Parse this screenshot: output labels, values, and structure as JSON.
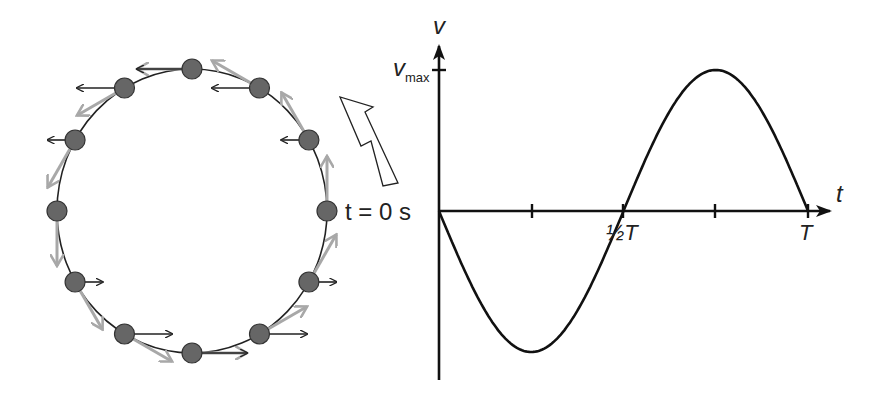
{
  "circle_diagram": {
    "title": "Uniform circular motion projected onto horizontal axis",
    "start_label": "t = 0 s",
    "direction": "counter-clockwise",
    "ball_count": 12,
    "colors": {
      "ball": "#666666",
      "velocity_arrow": "#a8a8a8",
      "horizontal_arrow": "#222222"
    }
  },
  "graph": {
    "y_axis_label": "v",
    "x_axis_label": "t",
    "y_tick_label": "v",
    "y_tick_sub": "max",
    "x_tick_half": "½T",
    "x_tick_full": "T"
  },
  "chart_data": {
    "type": "line",
    "title": "",
    "xlabel": "t",
    "ylabel": "v",
    "x": [
      "0",
      "¼T",
      "½T",
      "¾T",
      "T"
    ],
    "series": [
      {
        "name": "v(t)",
        "values": [
          0,
          -1,
          0,
          1,
          0
        ]
      }
    ],
    "ylim": [
      -1,
      1
    ],
    "grid": false
  }
}
